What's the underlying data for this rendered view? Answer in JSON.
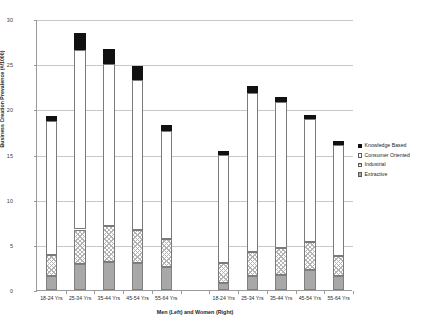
{
  "chart_data": {
    "type": "bar",
    "subtype": "stacked",
    "title": "",
    "xlabel": "Men (Left) and Women (Right)",
    "ylabel": "Business Creation Prevalence (#/1000)",
    "ylim": [
      0,
      30
    ],
    "ytick_values": [
      0,
      5,
      10,
      15,
      20,
      25,
      30
    ],
    "ytick_labels": [
      "0",
      "5",
      "10",
      "15",
      "20",
      "25",
      "30"
    ],
    "grid": true,
    "legend_position": "right",
    "group_gap_category": "",
    "categories": [
      "18-24 Yrs",
      "25-34 Yrs",
      "35-44 Yrs",
      "45-54 Yrs",
      "55-64 Yrs",
      "",
      "18-24 Yrs",
      "25-34 Yrs",
      "35-44 Yrs",
      "45-54 Yrs",
      "55-64 Yrs"
    ],
    "groups": [
      {
        "name": "Men (Left)",
        "categories": [
          "18-24 Yrs",
          "25-34 Yrs",
          "35-44 Yrs",
          "45-54 Yrs",
          "55-64 Yrs"
        ]
      },
      {
        "name": "Women (Right)",
        "categories": [
          "18-24 Yrs",
          "25-34 Yrs",
          "35-44 Yrs",
          "45-54 Yrs",
          "55-64 Yrs"
        ]
      }
    ],
    "series": [
      {
        "name": "Extractive",
        "swatch": "extractive",
        "values": [
          1.6,
          2.9,
          3.1,
          3.0,
          2.6,
          null,
          0.8,
          1.5,
          1.7,
          2.2,
          1.6
        ]
      },
      {
        "name": "Industrial",
        "swatch": "industrial",
        "values": [
          2.3,
          3.8,
          4.0,
          3.6,
          3.0,
          null,
          2.2,
          2.7,
          2.9,
          3.1,
          2.2
        ]
      },
      {
        "name": "Consumer Oriented",
        "swatch": "consumer",
        "values": [
          14.8,
          19.9,
          17.9,
          16.7,
          12.0,
          null,
          12.0,
          17.6,
          16.2,
          13.6,
          12.3
        ]
      },
      {
        "name": "Knowledge Based",
        "swatch": "knowledge",
        "values": [
          0.6,
          1.8,
          1.7,
          1.5,
          0.7,
          null,
          0.4,
          0.8,
          0.6,
          0.5,
          0.4
        ]
      }
    ],
    "totals": [
      19.3,
      28.4,
      26.7,
      24.8,
      18.3,
      null,
      15.4,
      22.6,
      21.4,
      19.4,
      16.5
    ]
  },
  "legend": {
    "items": [
      {
        "label": "Knowledge Based",
        "swatch": "knowledge"
      },
      {
        "label": "Consumer Oriented",
        "swatch": "consumer"
      },
      {
        "label": "Industrial",
        "swatch": "industrial"
      },
      {
        "label": "Extractive",
        "swatch": "extractive"
      }
    ]
  }
}
